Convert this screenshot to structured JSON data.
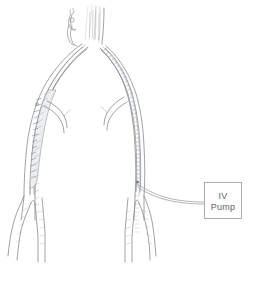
{
  "figure": {
    "background_color": "#ffffff",
    "line_color": "#8e9196",
    "width": 256,
    "height": 283
  },
  "pump": {
    "label_line1": "IV",
    "label_line2": "Pump",
    "box_color": "#a9acb1",
    "text_color": "#5f6368"
  },
  "anatomy": {
    "main_trunk_name": "aorta",
    "left_branch_name": "left iliac artery",
    "right_branch_name": "right iliac artery",
    "left_catheter_name": "left intravascular catheter",
    "right_catheter_name": "right intravascular catheter",
    "tubing_name": "infusion tubing"
  }
}
